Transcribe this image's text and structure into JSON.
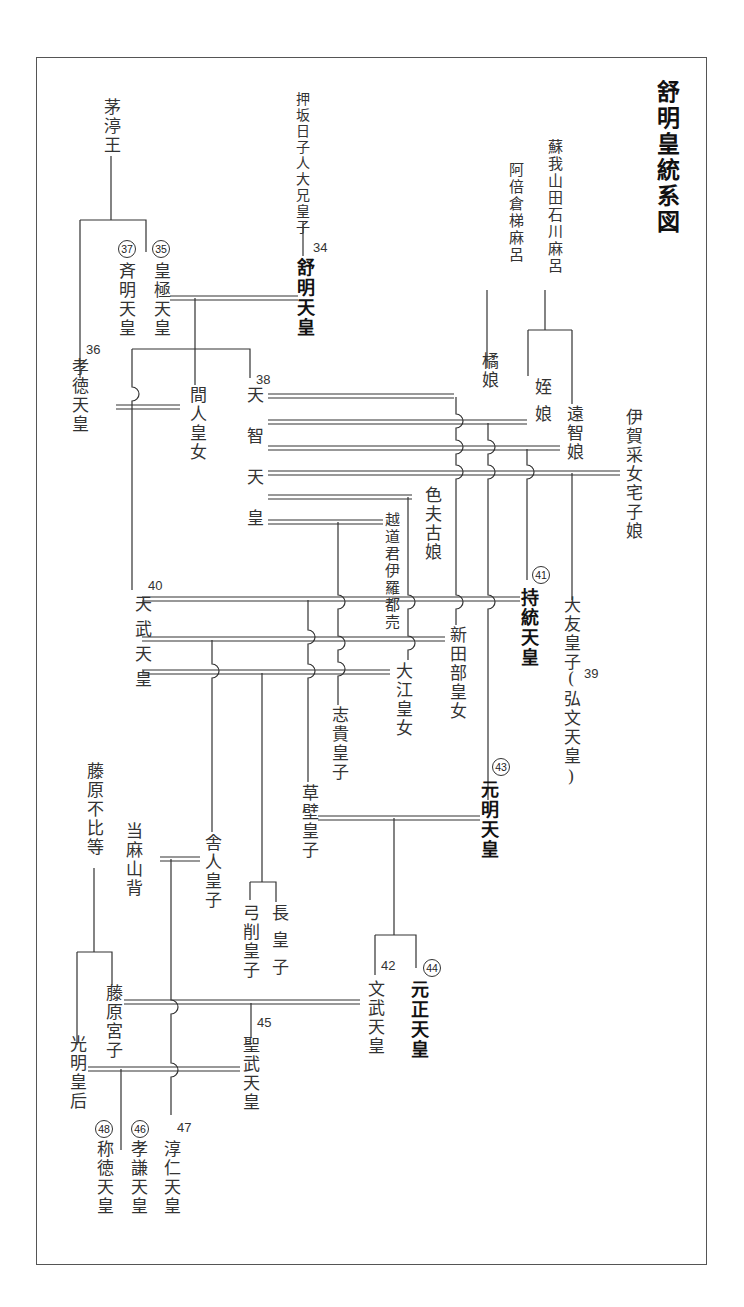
{
  "title": "舒明皇統系図",
  "colors": {
    "line": "#333333",
    "frame": "#555555",
    "text": "#333333"
  },
  "persons": {
    "chinu": "茅渟王",
    "oshisaka": "押坂日子人大兄皇子",
    "jomei": "舒明天皇",
    "kogyoku": "皇極天皇",
    "saimei": "斉明天皇",
    "kotoku": "孝徳天皇",
    "hashihito": "間人皇女",
    "tenji": "天智天皇",
    "abe": "阿倍倉梯麻呂",
    "tachibana": "橘娘",
    "soga": "蘇我山田石川麻呂",
    "mei": "姪娘",
    "ochi": "遠智娘",
    "iga": "伊賀采女宅子娘",
    "shikobu": "色夫古娘",
    "koshi": "越道君伊羅都売",
    "jito": "持統天皇",
    "otomo": "大友皇子",
    "kobun": "(弘文天皇)",
    "tenmu": "天武天皇",
    "niitabe": "新田部皇女",
    "oe": "大江皇女",
    "shiki": "志貴皇子",
    "genmei": "元明天皇",
    "kusakabe": "草壁皇子",
    "toneri": "舎人皇子",
    "yuge": "弓削皇子",
    "naga": "長皇子",
    "fuhito": "藤原不比等",
    "taima": "当麻山背",
    "monmu": "文武天皇",
    "gensho": "元正天皇",
    "miyako": "藤原宮子",
    "shomu": "聖武天皇",
    "komyo": "光明皇后",
    "shotoku": "称徳天皇",
    "koken": "孝謙天皇",
    "junnin": "淳仁天皇"
  },
  "reign_numbers": {
    "jomei": "34",
    "kogyoku": "35",
    "kotoku": "36",
    "saimei": "37",
    "tenji": "38",
    "kobun": "39",
    "tenmu": "40",
    "jito": "41",
    "monmu": "42",
    "genmei": "43",
    "gensho": "44",
    "shomu": "45",
    "koken": "46",
    "junnin": "47",
    "shotoku": "48"
  },
  "legend": {
    "circled_numbers": "female sovereigns",
    "plain_numbers": "male sovereigns",
    "double_line": "marriage",
    "single_line": "descent"
  }
}
